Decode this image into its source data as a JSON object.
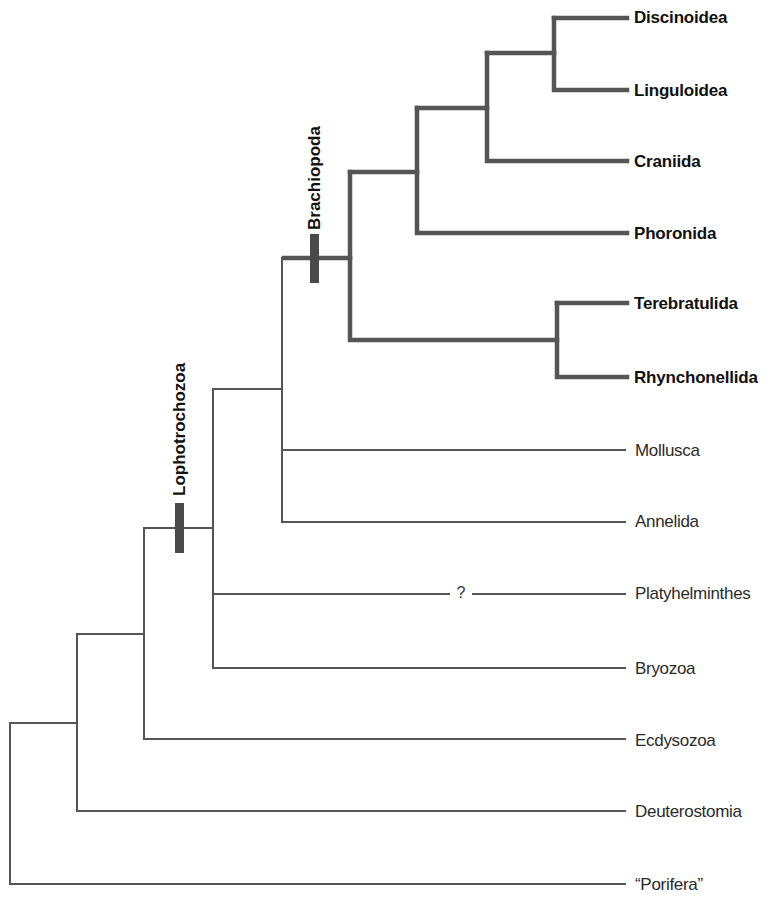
{
  "diagram": {
    "type": "phylogenetic-tree",
    "colors": {
      "thick_branch": "#555555",
      "thin_branch": "#555555",
      "marker": "#4a4a4a",
      "bold_text": "#111111",
      "thin_text": "#2a2a2a"
    },
    "clades": [
      {
        "id": "lophotrochozoa",
        "label": "Lophotrochozoa"
      },
      {
        "id": "brachiopoda",
        "label": "Brachiopoda"
      }
    ],
    "uncertain_marker": "?",
    "taxa": [
      {
        "id": "discinoidea",
        "label": "Discinoidea",
        "emphasis": "bold"
      },
      {
        "id": "linguloidea",
        "label": "Linguloidea",
        "emphasis": "bold"
      },
      {
        "id": "craniida",
        "label": "Craniida",
        "emphasis": "bold"
      },
      {
        "id": "phoronida",
        "label": "Phoronida",
        "emphasis": "bold"
      },
      {
        "id": "terebratulida",
        "label": "Terebratulida",
        "emphasis": "bold"
      },
      {
        "id": "rhynchonellida",
        "label": "Rhynchonellida",
        "emphasis": "bold"
      },
      {
        "id": "mollusca",
        "label": "Mollusca",
        "emphasis": "normal"
      },
      {
        "id": "annelida",
        "label": "Annelida",
        "emphasis": "normal"
      },
      {
        "id": "platyhelminthes",
        "label": "Platyhelminthes",
        "emphasis": "normal"
      },
      {
        "id": "bryozoa",
        "label": "Bryozoa",
        "emphasis": "normal"
      },
      {
        "id": "ecdysozoa",
        "label": "Ecdysozoa",
        "emphasis": "normal"
      },
      {
        "id": "deuterostomia",
        "label": "Deuterostomia",
        "emphasis": "normal"
      },
      {
        "id": "porifera",
        "label": "“Porifera”",
        "emphasis": "normal"
      }
    ]
  }
}
